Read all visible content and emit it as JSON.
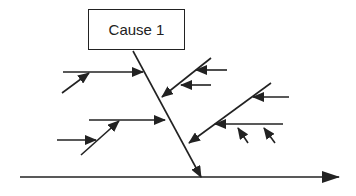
{
  "diagram": {
    "type": "fishbone",
    "cause_box": {
      "label": "Cause 1"
    },
    "colors": {
      "stroke": "#222222",
      "background": "#ffffff"
    },
    "spine": {
      "x1": 20,
      "y1": 177,
      "x2": 339,
      "y2": 177
    },
    "main_bone": {
      "x1": 133,
      "y1": 51,
      "x2": 201,
      "y2": 177
    },
    "sub_causes": [
      {
        "side": "left",
        "bone": {
          "x1": 63,
          "y1": 72,
          "x2": 143,
          "y2": 72
        },
        "sub_arrows": [
          {
            "x1": 62,
            "y1": 93,
            "x2": 89,
            "y2": 73
          }
        ]
      },
      {
        "side": "left",
        "bone": {
          "x1": 89,
          "y1": 120,
          "x2": 165,
          "y2": 120
        },
        "sub_arrows": [
          {
            "x1": 81,
            "y1": 155,
            "x2": 119,
            "y2": 121
          },
          {
            "x1": 57,
            "y1": 140,
            "x2": 96,
            "y2": 140
          }
        ]
      },
      {
        "side": "right",
        "bone": {
          "x1": 211,
          "y1": 58,
          "x2": 162,
          "y2": 97
        },
        "sub_arrows": [
          {
            "x1": 227,
            "y1": 70,
            "x2": 196,
            "y2": 70
          },
          {
            "x1": 211,
            "y1": 85,
            "x2": 181,
            "y2": 85
          }
        ]
      },
      {
        "side": "right",
        "bone": {
          "x1": 271,
          "y1": 83,
          "x2": 189,
          "y2": 143
        },
        "sub_arrows": [
          {
            "x1": 289,
            "y1": 97,
            "x2": 253,
            "y2": 97
          },
          {
            "x1": 283,
            "y1": 124,
            "x2": 215,
            "y2": 124
          }
        ],
        "sub_sub_arrows": [
          {
            "x1": 248,
            "y1": 143,
            "x2": 238,
            "y2": 128
          },
          {
            "x1": 275,
            "y1": 143,
            "x2": 264,
            "y2": 128
          }
        ]
      }
    ]
  }
}
